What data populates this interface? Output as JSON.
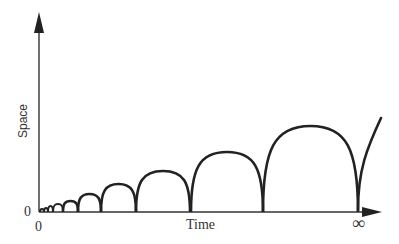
{
  "diagram": {
    "type": "bouncing-arches",
    "axes": {
      "x_label": "Time",
      "y_label": "Space",
      "x_origin_label": "0",
      "y_origin_label": "0",
      "x_end_label": "∞"
    },
    "colors": {
      "stroke": "#222222",
      "axis": "#333333",
      "background": "#ffffff"
    },
    "arches": [
      {
        "x0": 40,
        "x1": 44,
        "peak_y": 209
      },
      {
        "x0": 44,
        "x1": 48,
        "peak_y": 208
      },
      {
        "x0": 48,
        "x1": 53,
        "peak_y": 206
      },
      {
        "x0": 53,
        "x1": 63,
        "peak_y": 204
      },
      {
        "x0": 63,
        "x1": 78,
        "peak_y": 201
      },
      {
        "x0": 78,
        "x1": 101,
        "peak_y": 194
      },
      {
        "x0": 101,
        "x1": 136,
        "peak_y": 184
      },
      {
        "x0": 136,
        "x1": 190,
        "peak_y": 171
      },
      {
        "x0": 191,
        "x1": 263,
        "peak_y": 152
      },
      {
        "x0": 263,
        "x1": 358,
        "peak_y": 126
      }
    ],
    "tail": {
      "x0": 358,
      "y0": 210,
      "x1": 381,
      "y1": 118
    }
  }
}
